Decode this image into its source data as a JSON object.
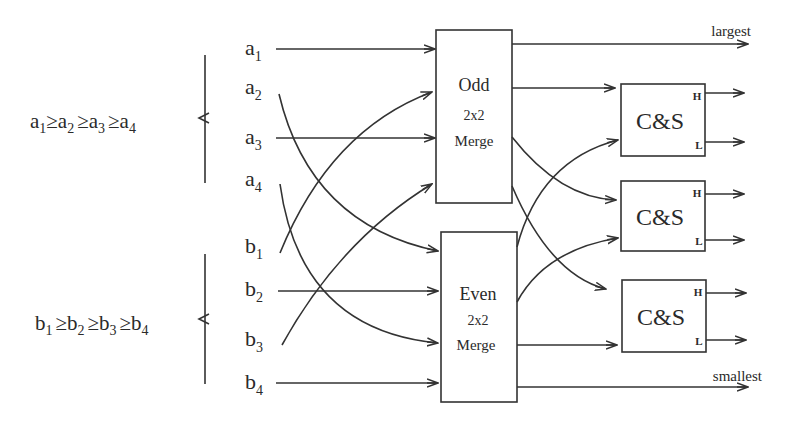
{
  "diagram": {
    "type": "odd-even merge network (4+4 inputs)",
    "inequalities": {
      "a": {
        "base": [
          "a",
          "a",
          "a",
          "a"
        ],
        "subs": [
          "1",
          "2",
          "3",
          "4"
        ],
        "relation": "≥"
      },
      "b": {
        "base": [
          "b",
          "b",
          "b",
          "b"
        ],
        "subs": [
          "1",
          "2",
          "3",
          "4"
        ],
        "relation": "≥"
      }
    },
    "inputs": {
      "a": [
        {
          "base": "a",
          "sub": "1"
        },
        {
          "base": "a",
          "sub": "2"
        },
        {
          "base": "a",
          "sub": "3"
        },
        {
          "base": "a",
          "sub": "4"
        }
      ],
      "b": [
        {
          "base": "b",
          "sub": "1"
        },
        {
          "base": "b",
          "sub": "2"
        },
        {
          "base": "b",
          "sub": "3"
        },
        {
          "base": "b",
          "sub": "4"
        }
      ]
    },
    "merge_boxes": {
      "odd": {
        "line1": "Odd",
        "line2": "2x2",
        "line3": "Merge"
      },
      "even": {
        "line1": "Even",
        "line2": "2x2",
        "line3": "Merge"
      }
    },
    "cs_boxes": [
      {
        "label": "C&S",
        "high": "H",
        "low": "L"
      },
      {
        "label": "C&S",
        "high": "H",
        "low": "L"
      },
      {
        "label": "C&S",
        "high": "H",
        "low": "L"
      }
    ],
    "outputs": {
      "top": "largest",
      "bottom": "smallest"
    },
    "connections": [
      {
        "from": "a1",
        "to": "odd-merge"
      },
      {
        "from": "a3",
        "to": "odd-merge"
      },
      {
        "from": "b1",
        "to": "odd-merge"
      },
      {
        "from": "b3",
        "to": "odd-merge"
      },
      {
        "from": "a2",
        "to": "even-merge"
      },
      {
        "from": "a4",
        "to": "even-merge"
      },
      {
        "from": "b2",
        "to": "even-merge"
      },
      {
        "from": "b4",
        "to": "even-merge"
      },
      {
        "from": "odd-merge.out1",
        "to": "largest"
      },
      {
        "from": "odd-merge.out2",
        "to": "cs1"
      },
      {
        "from": "odd-merge.out3",
        "to": "cs2"
      },
      {
        "from": "odd-merge.out4",
        "to": "cs3"
      },
      {
        "from": "even-merge.out1",
        "to": "cs1"
      },
      {
        "from": "even-merge.out2",
        "to": "cs2"
      },
      {
        "from": "even-merge.out3",
        "to": "cs3"
      },
      {
        "from": "even-merge.out4",
        "to": "smallest"
      }
    ]
  }
}
